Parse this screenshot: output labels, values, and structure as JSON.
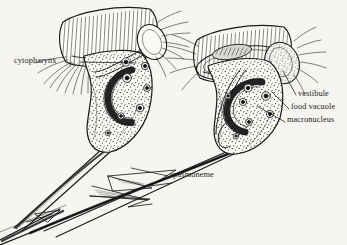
{
  "figure": {
    "background_color": "#f6f5f1",
    "ink_color": "#1a1a1a",
    "width": 347,
    "height": 245,
    "style": "pen-and-ink scientific line drawing with stipple shading"
  },
  "labels": [
    {
      "id": "cytopharynx",
      "text": "cytopharynx",
      "x": 14,
      "y": 57,
      "align": "left",
      "leader": {
        "from_x": 80,
        "from_y": 62,
        "to_x": 136,
        "to_y": 63
      }
    },
    {
      "id": "vestibule",
      "text": "vestibule",
      "x": 298,
      "y": 93,
      "align": "left",
      "leader": {
        "from_x": 296,
        "from_y": 95,
        "to_x": 283,
        "to_y": 71
      }
    },
    {
      "id": "food-vacuole",
      "text": "food vacuole",
      "x": 291,
      "y": 106,
      "align": "left",
      "leader": {
        "from_x": 289,
        "from_y": 109,
        "to_x": 272,
        "to_y": 92
      }
    },
    {
      "id": "macronucleus",
      "text": "macronucleus",
      "x": 287,
      "y": 119,
      "align": "left",
      "leader": {
        "from_x": 285,
        "from_y": 122,
        "to_x": 257,
        "to_y": 106
      }
    },
    {
      "id": "spasmoneme",
      "text": "spasmoneme",
      "x": 170,
      "y": 172,
      "align": "left",
      "leader": {
        "from_x": 168,
        "from_y": 176,
        "to_x": 131,
        "to_y": 168
      }
    }
  ],
  "structures": [
    {
      "name": "peristomial-ciliary-band",
      "count": 2,
      "description": "dense parallel hatched fan of membranelles at the oral end of each zooid"
    },
    {
      "name": "oral-cilia-fringe",
      "count": 2,
      "description": "splayed long cilia radiating from the oral rim"
    },
    {
      "name": "cell-body",
      "count": 2,
      "description": "stippled pear-shaped zooid body"
    },
    {
      "name": "macronucleus",
      "count": 2,
      "description": "curved horseshoe band of coarse granules inside each zooid"
    },
    {
      "name": "food-vacuole",
      "count": 9,
      "description": "dark-centred circular vacuoles in the cytoplasm"
    },
    {
      "name": "vestibule",
      "count": 2,
      "description": "rounded oral vestibule pocket adjoining the peristome"
    },
    {
      "name": "cytopharynx",
      "count": 1,
      "description": "tube leading inward from the vestibule of the left zooid"
    },
    {
      "name": "stalk",
      "count": 2,
      "description": "two tapering stalks converging toward lower left"
    },
    {
      "name": "spasmoneme",
      "count": 1,
      "description": "dark contractile fibre running within the common stalk"
    }
  ]
}
